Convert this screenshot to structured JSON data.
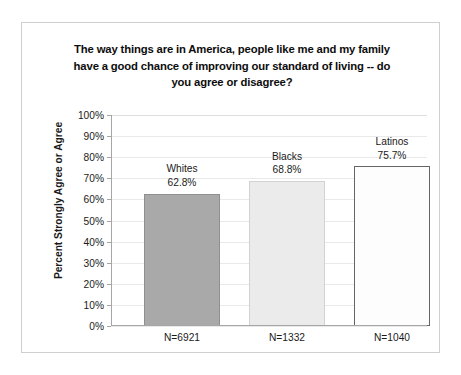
{
  "chart_data": {
    "type": "bar",
    "title": "The way things are in America, people like me and my family have a good chance of improving our standard of living -- do you agree or disagree?",
    "title_lines": [
      "The way things are in America, people like me and my family",
      "have a good chance of improving our standard of living -- do",
      "you agree or disagree?"
    ],
    "categories": [
      "Whites",
      "Blacks",
      "Latinos"
    ],
    "values": [
      62.8,
      75.7,
      68.8
    ],
    "series": [
      {
        "name": "Percent Strongly Agree or Agree",
        "values": [
          62.8,
          68.8,
          75.7
        ]
      }
    ],
    "bars": [
      {
        "name": "Whites",
        "value": 62.8,
        "value_label": "62.8%",
        "x_label": "N=6921",
        "sample_size": 6921,
        "color": "#a9a9a9"
      },
      {
        "name": "Blacks",
        "value": 68.8,
        "value_label": "68.8%",
        "x_label": "N=1332",
        "sample_size": 1332,
        "color": "#ebebeb"
      },
      {
        "name": "Latinos",
        "value": 75.7,
        "value_label": "75.7%",
        "x_label": "N=1040",
        "sample_size": 1040,
        "color": "#fdfdfd"
      }
    ],
    "xlabel": "",
    "ylabel": "Percent Strongly Agree or Agree",
    "ylim": [
      0,
      100
    ],
    "ytick_values": [
      100,
      90,
      80,
      70,
      60,
      50,
      40,
      30,
      20,
      10,
      0
    ],
    "ytick_labels": [
      "100%",
      "90%",
      "80%",
      "70%",
      "60%",
      "50%",
      "40%",
      "30%",
      "20%",
      "10%",
      "0%"
    ],
    "grid": true,
    "legend": false,
    "legend_position": "none",
    "units": "percent"
  }
}
